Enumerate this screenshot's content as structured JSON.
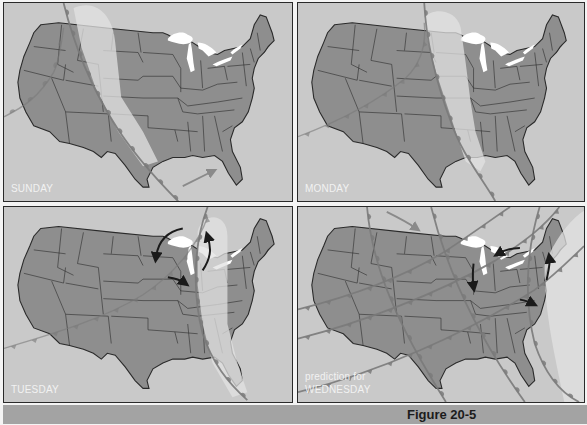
{
  "figure": {
    "caption": "Figure 20-5",
    "colors": {
      "background": "#c9c9c9",
      "land": "#8e8e8e",
      "state_border": "#2a2a2a",
      "lakes": "#ffffff",
      "high_pressure_band": "#e2e2e2",
      "front_line": "#7a7a7a",
      "arrow_dark": "#1a1a1a",
      "arrow_light": "#8a8a8a",
      "caption_bar": "#a3a3a3"
    }
  },
  "panels": [
    {
      "id": "sunday",
      "label": "SUNDAY",
      "label_line2": "",
      "high_band": "M70 5 C95 -5 110 15 112 40 L118 95 L140 130 L155 160 L140 165 L115 130 L92 85 L78 45 Z",
      "fronts": [
        {
          "type": "cold",
          "d": "M60 0 C70 40 85 80 110 120 C125 145 145 170 180 205"
        },
        {
          "type": "cold-faint",
          "d": "M0 115 C20 105 35 95 50 70 C55 60 58 40 60 25"
        }
      ],
      "arrows": [
        {
          "style": "light",
          "d": "M180 185 C190 180 200 175 210 170"
        }
      ]
    },
    {
      "id": "monday",
      "label": "MONDAY",
      "label_line2": "",
      "high_band": "M128 15 C135 5 160 5 165 25 L170 60 L175 100 L180 130 L190 160 L185 170 L170 160 L160 130 L150 100 L140 70 L132 40 Z",
      "fronts": [
        {
          "type": "cold",
          "d": "M128 0 C130 40 140 80 155 120 C165 150 185 175 200 200"
        },
        {
          "type": "warm-faint",
          "d": "M0 135 C40 120 80 100 110 75 C125 60 130 40 128 20"
        }
      ],
      "arrows": []
    },
    {
      "id": "tuesday",
      "label": "TUESDAY",
      "label_line2": "",
      "high_band": "M195 25 C200 5 225 5 225 30 L225 90 L225 120 L235 160 L245 190 L230 195 L210 160 L200 120 L195 80 Z",
      "fronts": [
        {
          "type": "cold",
          "d": "M205 0 C190 40 190 90 200 130 C210 160 225 180 245 198"
        },
        {
          "type": "warm-faint",
          "d": "M0 145 C50 130 100 115 140 90 C170 70 195 40 205 10"
        }
      ],
      "arrows": [
        {
          "style": "dark",
          "d": "M180 22 C165 25 155 35 153 52"
        },
        {
          "style": "dark",
          "d": "M200 65 C210 50 208 40 205 30"
        },
        {
          "style": "dark",
          "d": "M165 72 C172 73 178 75 182 78"
        }
      ]
    },
    {
      "id": "wednesday",
      "label": "prediction for",
      "label_line2": "WEDNESDAY",
      "high_band": "M250 60 C265 20 290 0 300 0 L300 200 L270 200 C260 150 250 110 250 60 Z",
      "fronts": [
        {
          "type": "cold",
          "d": "M70 0 C75 60 100 120 150 200"
        },
        {
          "type": "cold",
          "d": "M135 0 C150 60 180 130 230 200"
        },
        {
          "type": "cold",
          "d": "M245 0 C230 50 230 100 240 140 C250 170 265 190 285 200"
        },
        {
          "type": "warm",
          "d": "M0 105 C60 90 110 70 150 45 C180 25 200 10 215 0"
        },
        {
          "type": "warm",
          "d": "M0 135 C60 120 140 90 200 55 C230 35 250 20 265 0"
        },
        {
          "type": "warm",
          "d": "M0 190 C80 170 170 130 240 85 C260 70 275 55 290 40"
        }
      ],
      "arrows": [
        {
          "style": "light",
          "d": "M90 5 C100 10 110 15 120 22"
        },
        {
          "style": "dark",
          "d": "M225 42 C215 42 208 45 203 48"
        },
        {
          "style": "dark",
          "d": "M178 58 C177 68 177 76 178 82"
        },
        {
          "style": "dark",
          "d": "M252 75 C254 65 256 58 255 52"
        },
        {
          "style": "dark",
          "d": "M225 95 C230 96 234 97 238 99"
        }
      ]
    }
  ]
}
